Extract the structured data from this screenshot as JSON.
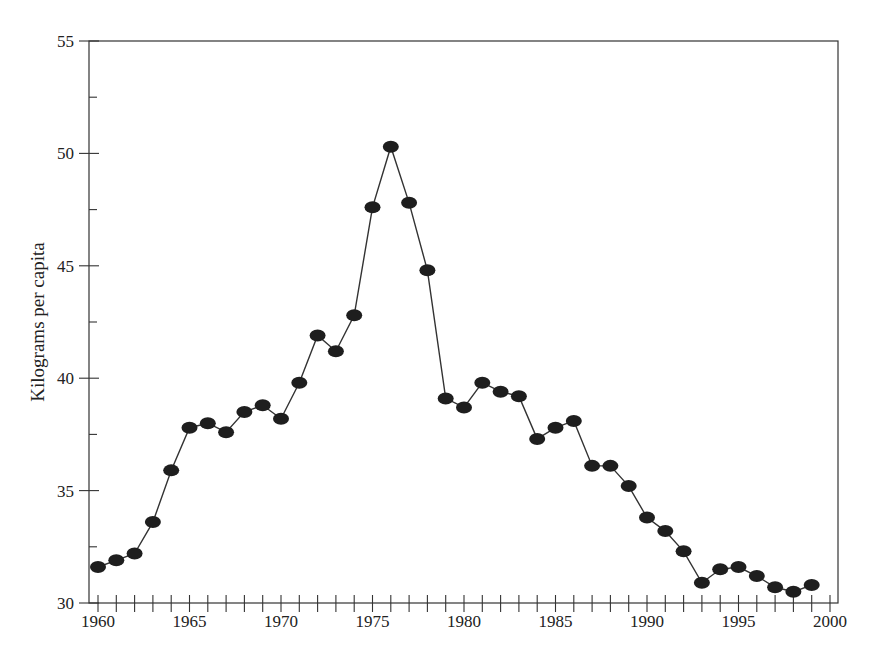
{
  "chart_data": {
    "type": "line",
    "title": "",
    "xlabel": "",
    "ylabel": "Kilograms per capita",
    "xlim": [
      1960,
      2000
    ],
    "ylim": [
      30,
      55
    ],
    "grid": false,
    "legend": null,
    "markers": "filled-ellipse",
    "x_ticks_major": [
      1960,
      1965,
      1970,
      1975,
      1980,
      1985,
      1990,
      1995,
      2000
    ],
    "y_ticks_major": [
      30,
      35,
      40,
      45,
      50,
      55
    ],
    "y_ticks_minor": [
      32.5,
      37.5,
      42.5,
      47.5,
      52.5
    ],
    "x": [
      1960,
      1961,
      1962,
      1963,
      1964,
      1965,
      1966,
      1967,
      1968,
      1969,
      1970,
      1971,
      1972,
      1973,
      1974,
      1975,
      1976,
      1977,
      1978,
      1979,
      1980,
      1981,
      1982,
      1983,
      1984,
      1985,
      1986,
      1987,
      1988,
      1989,
      1990,
      1991,
      1992,
      1993,
      1994,
      1995,
      1996,
      1997,
      1998,
      1999
    ],
    "series": [
      {
        "name": "Kilograms per capita",
        "values": [
          31.6,
          31.9,
          32.2,
          33.6,
          35.9,
          37.8,
          38.0,
          37.6,
          38.5,
          38.8,
          38.2,
          39.8,
          41.9,
          41.2,
          42.8,
          47.6,
          50.3,
          47.8,
          44.8,
          39.1,
          38.7,
          39.8,
          39.4,
          39.2,
          37.3,
          37.8,
          38.1,
          36.1,
          36.1,
          35.2,
          33.8,
          33.2,
          32.3,
          30.9,
          31.5,
          31.6,
          31.2,
          30.7,
          30.5,
          30.8
        ]
      }
    ]
  },
  "axes": {
    "ylabel": "Kilograms per capita"
  }
}
